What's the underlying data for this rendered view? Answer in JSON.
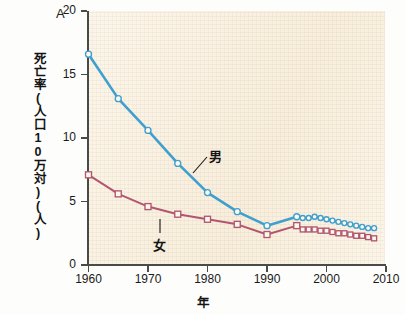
{
  "figure": {
    "panel_letter": "A",
    "y_axis_title": "死亡率(人口10万対)(人)",
    "x_axis_title": "年"
  },
  "axes": {
    "y_ticks": [
      0,
      5,
      10,
      15,
      20
    ],
    "x_ticks": [
      1960,
      1970,
      1980,
      1990,
      2000,
      2010
    ],
    "ylim": [
      0,
      20
    ],
    "xlim": [
      1955,
      2012
    ]
  },
  "annotations": {
    "male_label": "男",
    "female_label": "女"
  },
  "colors": {
    "male": "#3f9fcf",
    "female": "#b2566f",
    "plot_background": "#faf2e3",
    "axis": "#4a4a46",
    "page_background": "#fdfdfb"
  },
  "chart_data": {
    "type": "line",
    "title": "",
    "xlabel": "年",
    "ylabel": "死亡率(人口10万対)(人)",
    "xlim": [
      1955,
      2012
    ],
    "ylim": [
      0,
      20
    ],
    "grid": false,
    "legend": "inline-annotation",
    "series": [
      {
        "name": "男",
        "color": "#3f9fcf",
        "marker": "open-circle",
        "x": [
          1960,
          1965,
          1970,
          1975,
          1980,
          1985,
          1990,
          1995,
          1996,
          1997,
          1998,
          1999,
          2000,
          2001,
          2002,
          2003,
          2004,
          2005,
          2006,
          2007,
          2008
        ],
        "values": [
          16.6,
          13.1,
          10.6,
          8.0,
          5.7,
          4.2,
          3.1,
          3.8,
          3.7,
          3.7,
          3.8,
          3.7,
          3.6,
          3.5,
          3.4,
          3.3,
          3.2,
          3.1,
          3.0,
          2.9,
          2.9
        ]
      },
      {
        "name": "女",
        "color": "#b2566f",
        "marker": "open-square",
        "x": [
          1960,
          1965,
          1970,
          1975,
          1980,
          1985,
          1990,
          1995,
          1996,
          1997,
          1998,
          1999,
          2000,
          2001,
          2002,
          2003,
          2004,
          2005,
          2006,
          2007,
          2008
        ],
        "values": [
          7.1,
          5.6,
          4.6,
          4.0,
          3.6,
          3.2,
          2.4,
          3.1,
          2.8,
          2.8,
          2.8,
          2.7,
          2.7,
          2.6,
          2.5,
          2.5,
          2.4,
          2.3,
          2.3,
          2.2,
          2.1
        ]
      }
    ]
  }
}
